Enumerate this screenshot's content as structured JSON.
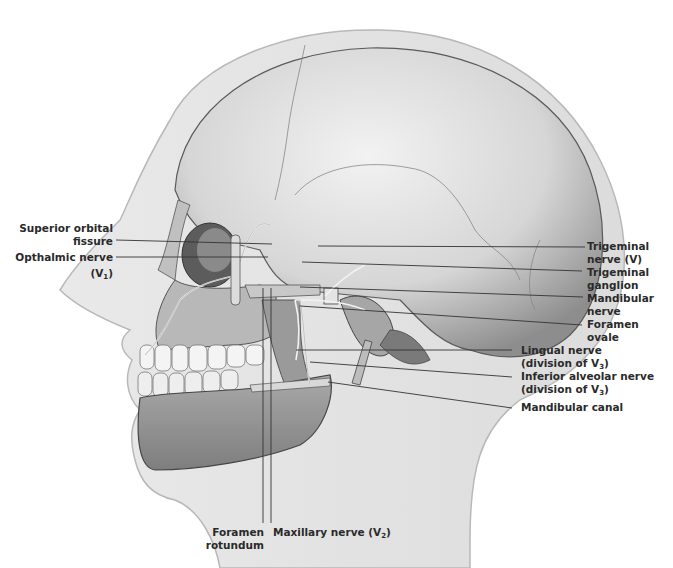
{
  "diagram": {
    "colors": {
      "background": "#ffffff",
      "skin": "#e6e6e6",
      "skin_outline": "#b8b8b8",
      "bone": "#cfcfcf",
      "bone_dark": "#7a7a7a",
      "leader_line": "#333333",
      "label_text": "#2a2a2a"
    }
  },
  "labels": {
    "left": [
      {
        "id": "superior-orbital-fissure",
        "line1": "Superior orbital",
        "line2": "fissure"
      },
      {
        "id": "opthalmic-nerve",
        "line1": "Opthalmic nerve",
        "line2_prefix": "(V",
        "line2_sub": "1",
        "line2_suffix": ")"
      }
    ],
    "right": [
      {
        "id": "trigeminal-nerve",
        "line1": "Trigeminal",
        "line2": "nerve (V)"
      },
      {
        "id": "trigeminal-ganglion",
        "line1": "Trigeminal",
        "line2": "ganglion"
      },
      {
        "id": "mandibular-nerve",
        "line1": "Mandibular",
        "line2": "nerve"
      },
      {
        "id": "foramen-ovale",
        "line1": "Foramen",
        "line2": "ovale"
      },
      {
        "id": "lingual-nerve",
        "line1": "Lingual nerve",
        "line2_prefix": "(division of V",
        "line2_sub": "3",
        "line2_suffix": ")"
      },
      {
        "id": "inferior-alveolar-nerve",
        "line1": "Inferior alveolar nerve",
        "line2_prefix": "(division of V",
        "line2_sub": "3",
        "line2_suffix": ")"
      },
      {
        "id": "mandibular-canal",
        "line1": "Mandibular canal"
      }
    ],
    "bottom": [
      {
        "id": "foramen-rotundum",
        "line1": "Foramen",
        "line2": "rotundum"
      },
      {
        "id": "maxillary-nerve",
        "line1_prefix": "Maxillary nerve (V",
        "line1_sub": "2",
        "line1_suffix": ")"
      }
    ]
  }
}
